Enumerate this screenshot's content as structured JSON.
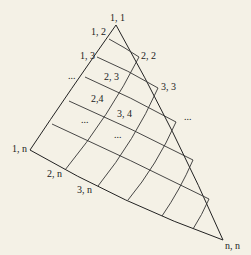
{
  "diagram": {
    "title": "",
    "background": "#f4f1e6",
    "stroke_color": "#222222",
    "vertices": {
      "apex": {
        "label": "1, 1",
        "x": 116,
        "y": 25
      },
      "left": {
        "label": "1, n",
        "x": 30,
        "y": 150
      },
      "right": {
        "label": "n, n",
        "x": 223,
        "y": 240
      }
    },
    "labels": [
      {
        "id": "l11",
        "text": "1, 1",
        "x": 110,
        "y": 21
      },
      {
        "id": "l12",
        "text": "1, 2",
        "x": 91,
        "y": 35
      },
      {
        "id": "l13",
        "text": "1, 3",
        "x": 80,
        "y": 59
      },
      {
        "id": "ldotsL",
        "text": "...",
        "x": 68,
        "y": 79
      },
      {
        "id": "l22",
        "text": "2, 2",
        "x": 141,
        "y": 59
      },
      {
        "id": "l23",
        "text": "2, 3",
        "x": 104,
        "y": 80
      },
      {
        "id": "l33",
        "text": "3, 3",
        "x": 161,
        "y": 90
      },
      {
        "id": "l24",
        "text": "2,4",
        "x": 91,
        "y": 102
      },
      {
        "id": "l34",
        "text": "3, 4",
        "x": 117,
        "y": 117
      },
      {
        "id": "ldotsR",
        "text": "...",
        "x": 184,
        "y": 120
      },
      {
        "id": "ldotsM1",
        "text": "...",
        "x": 81,
        "y": 123
      },
      {
        "id": "ldotsM2",
        "text": "...",
        "x": 114,
        "y": 138
      },
      {
        "id": "l1n",
        "text": "1, n",
        "x": 12,
        "y": 152
      },
      {
        "id": "l2n",
        "text": "2, n",
        "x": 47,
        "y": 177
      },
      {
        "id": "l3n",
        "text": "3, n",
        "x": 77,
        "y": 193
      },
      {
        "id": "lnn",
        "text": "n, n",
        "x": 225,
        "y": 249
      }
    ],
    "row_lines": [
      {
        "from": [
          109,
          39
        ],
        "ctrl": [
          124,
          47
        ],
        "to": [
          139,
          57
        ]
      },
      {
        "from": [
          97,
          57
        ],
        "ctrl": [
          128,
          70
        ],
        "to": [
          158,
          88
        ]
      },
      {
        "from": [
          85,
          77
        ],
        "ctrl": [
          131,
          97
        ],
        "to": [
          176,
          122
        ]
      },
      {
        "from": [
          69,
          101
        ],
        "ctrl": [
          131,
          128
        ],
        "to": [
          193,
          160
        ]
      },
      {
        "from": [
          52,
          124
        ],
        "ctrl": [
          131,
          160
        ],
        "to": [
          209,
          199
        ]
      }
    ],
    "col_lines": [
      {
        "from": [
          65,
          170
        ],
        "ctrl": [
          110,
          115
        ],
        "to": [
          139,
          57
        ]
      },
      {
        "from": [
          98,
          186
        ],
        "ctrl": [
          135,
          140
        ],
        "to": [
          158,
          88
        ]
      },
      {
        "from": [
          128,
          200
        ],
        "ctrl": [
          157,
          165
        ],
        "to": [
          176,
          122
        ]
      },
      {
        "from": [
          162,
          216
        ],
        "ctrl": [
          180,
          190
        ],
        "to": [
          193,
          160
        ]
      },
      {
        "from": [
          193,
          229
        ],
        "ctrl": [
          202,
          215
        ],
        "to": [
          209,
          199
        ]
      }
    ],
    "left_edge": {
      "from": [
        116,
        25
      ],
      "ctrl": [
        70,
        90
      ],
      "to": [
        30,
        150
      ]
    },
    "right_edge": {
      "from": [
        116,
        25
      ],
      "ctrl": [
        175,
        130
      ],
      "to": [
        223,
        240
      ]
    },
    "bottom_edge": {
      "from": [
        30,
        150
      ],
      "ctrl": [
        125,
        205
      ],
      "to": [
        223,
        240
      ]
    }
  }
}
